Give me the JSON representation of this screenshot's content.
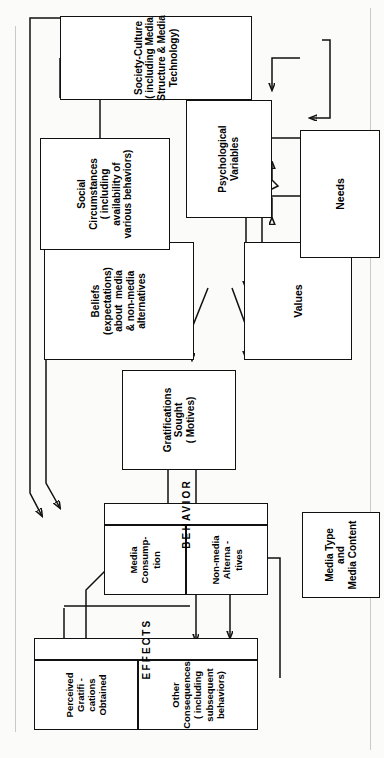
{
  "diagram": {
    "orientation": "rotated-90-ccw",
    "nodes": {
      "media_type": {
        "lines": [
          "Media Type",
          "and",
          "Media Content"
        ]
      },
      "effects_band": {
        "label": "EFFECTS"
      },
      "perceived_gratifications": {
        "lines": [
          "Perceived",
          "Gratifi -",
          "cations",
          "Obtained"
        ]
      },
      "other_consequences": {
        "lines": [
          "Other",
          "Consequences",
          "( including",
          "subsequent",
          "behaviors)"
        ]
      },
      "behavior_band": {
        "label": "BEHAVIOR"
      },
      "media_consumption": {
        "lines": [
          "Media",
          "Consump-",
          "tion"
        ]
      },
      "non_media_alternatives": {
        "lines": [
          "Non-media",
          "Alterna -",
          "tives"
        ]
      },
      "gratifications_sought": {
        "lines": [
          "Gratifications",
          "Sought",
          "( Motives)"
        ]
      },
      "beliefs": {
        "lines": [
          "Beliefs",
          "(expectations)",
          "about  media",
          "& non-media",
          "alternatives"
        ]
      },
      "values": {
        "lines": [
          "Values"
        ]
      },
      "social_circumstances": {
        "lines": [
          "Social",
          "Circumstances",
          "( including",
          "availability of",
          "various behaviors)"
        ]
      },
      "psychological_variables": {
        "lines": [
          "Psychological",
          "Variables"
        ]
      },
      "needs": {
        "lines": [
          "Needs"
        ]
      },
      "society_culture": {
        "lines": [
          "Society-Culture",
          "( including Media",
          "Structure & Media",
          "Technology)"
        ]
      }
    },
    "colors": {
      "ink": "#111111",
      "paper": "#fbfbf9",
      "page_edge": "#c9c9c9"
    }
  }
}
